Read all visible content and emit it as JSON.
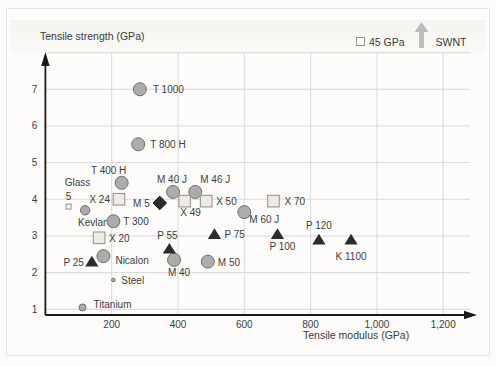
{
  "chart_data": {
    "type": "scatter",
    "xlabel": "Tensile modulus (GPa)",
    "ylabel": "Tensile strength (GPa)",
    "xlim": [
      0,
      1300
    ],
    "ylim": [
      1,
      8
    ],
    "grid": true,
    "x_ticks": [
      {
        "v": 200,
        "label": "200"
      },
      {
        "v": 400,
        "label": "400"
      },
      {
        "v": 600,
        "label": "600"
      },
      {
        "v": 800,
        "label": "800"
      },
      {
        "v": 1000,
        "label": "1,000"
      },
      {
        "v": 1200,
        "label": "1,200"
      }
    ],
    "y_ticks": [
      {
        "v": 1,
        "label": "1"
      },
      {
        "v": 2,
        "label": "2"
      },
      {
        "v": 3,
        "label": "3"
      },
      {
        "v": 4,
        "label": "4"
      },
      {
        "v": 5,
        "label": "5"
      },
      {
        "v": 6,
        "label": "6"
      },
      {
        "v": 7,
        "label": "7"
      }
    ],
    "annotation": {
      "square_label": "45 GPa",
      "arrow_label": "SWNT"
    },
    "colors": {
      "grid": "#dbd9d4",
      "axis": "#1a1a1a",
      "text": "#3c3c3c",
      "circle_fill": "#acacac",
      "circle_stroke": "#6f6f6f",
      "square_fill": "#edebe2",
      "square_stroke": "#98968f",
      "open_square_fill": "#fdfdfb",
      "open_square_stroke": "#8c8c8c",
      "dark_marker": "#2b2b2b",
      "swnt_arrow": "#bcbcbc"
    },
    "points": [
      {
        "label": "T 1000",
        "marker": "circle",
        "size": "large",
        "x": 285,
        "y": 7.0,
        "anchor": "start",
        "dx": 13,
        "dy": 4
      },
      {
        "label": "T 800 H",
        "marker": "circle",
        "size": "large",
        "x": 280,
        "y": 5.5,
        "anchor": "start",
        "dx": 12,
        "dy": 4
      },
      {
        "label": "T 400 H",
        "marker": "circle",
        "size": "large",
        "x": 230,
        "y": 4.45,
        "anchor": "middle",
        "dx": -13,
        "dy": -9
      },
      {
        "label": "T 300",
        "marker": "circle",
        "size": "large",
        "x": 205,
        "y": 3.4,
        "anchor": "start",
        "dx": 10,
        "dy": 4
      },
      {
        "label": "M 40 J",
        "marker": "circle",
        "size": "large",
        "x": 385,
        "y": 4.2,
        "anchor": "middle",
        "dx": -1,
        "dy": -9
      },
      {
        "label": "M 46 J",
        "marker": "circle",
        "size": "large",
        "x": 452,
        "y": 4.2,
        "anchor": "middle",
        "dx": 20,
        "dy": -9
      },
      {
        "label": "M 60 J",
        "marker": "circle",
        "size": "large",
        "x": 600,
        "y": 3.65,
        "anchor": "start",
        "dx": 5,
        "dy": 11
      },
      {
        "label": "M 40",
        "marker": "circle",
        "size": "large",
        "x": 388,
        "y": 2.35,
        "anchor": "middle",
        "dx": 5,
        "dy": 16
      },
      {
        "label": "M 50",
        "marker": "circle",
        "size": "large",
        "x": 490,
        "y": 2.3,
        "anchor": "start",
        "dx": 10,
        "dy": 4
      },
      {
        "label": "Nicalon",
        "marker": "circle",
        "size": "large",
        "x": 175,
        "y": 2.45,
        "anchor": "start",
        "dx": 12,
        "dy": 8
      },
      {
        "label": "Kevlar",
        "marker": "circle",
        "size": "medium",
        "x": 120,
        "y": 3.7,
        "anchor": "middle",
        "dx": 7,
        "dy": 16
      },
      {
        "label": "Titanium",
        "marker": "circle",
        "size": "small",
        "x": 112,
        "y": 1.05,
        "anchor": "start",
        "dx": 11,
        "dy": 1
      },
      {
        "label": "Steel",
        "marker": "circle",
        "size": "dot",
        "x": 205,
        "y": 1.8,
        "anchor": "start",
        "dx": 8,
        "dy": 4
      },
      {
        "label": "X 24",
        "marker": "square",
        "x": 222,
        "y": 4.0,
        "anchor": "end",
        "dx": -9,
        "dy": 4
      },
      {
        "label": "X 49",
        "marker": "square",
        "x": 420,
        "y": 3.95,
        "anchor": "middle",
        "dx": 6,
        "dy": 15
      },
      {
        "label": "X 50",
        "marker": "square",
        "x": 485,
        "y": 3.95,
        "anchor": "start",
        "dx": 10,
        "dy": 4
      },
      {
        "label": "X 70",
        "marker": "square",
        "x": 688,
        "y": 3.95,
        "anchor": "start",
        "dx": 11,
        "dy": 4
      },
      {
        "label": "X 20",
        "marker": "square",
        "x": 162,
        "y": 2.95,
        "anchor": "start",
        "dx": 10,
        "dy": 4
      },
      {
        "label": "Glass 5",
        "marker": "open-square",
        "x": 70,
        "y": 3.8,
        "lines": [
          {
            "text": "Glass",
            "dx": 9,
            "dy": -21
          },
          {
            "text": "5",
            "dx": 0,
            "dy": -7
          }
        ]
      },
      {
        "label": "M 5",
        "marker": "diamond",
        "x": 345,
        "y": 3.9,
        "anchor": "end",
        "dx": -10,
        "dy": 4
      },
      {
        "label": "P 25",
        "marker": "triangle",
        "x": 140,
        "y": 2.3,
        "anchor": "end",
        "dx": -8,
        "dy": 4
      },
      {
        "label": "P 55",
        "marker": "triangle",
        "x": 374,
        "y": 2.65,
        "anchor": "middle",
        "dx": -2,
        "dy": -10
      },
      {
        "label": "P 75",
        "marker": "triangle",
        "x": 510,
        "y": 3.05,
        "anchor": "start",
        "dx": 10,
        "dy": 4
      },
      {
        "label": "P 100",
        "marker": "triangle",
        "x": 700,
        "y": 3.05,
        "anchor": "middle",
        "dx": 5,
        "dy": 16
      },
      {
        "label": "P 120",
        "marker": "triangle",
        "x": 825,
        "y": 2.9,
        "anchor": "middle",
        "dx": 0,
        "dy": -11
      },
      {
        "label": "K 1100",
        "marker": "triangle",
        "x": 922,
        "y": 2.9,
        "anchor": "middle",
        "dx": 0,
        "dy": 20
      }
    ]
  }
}
